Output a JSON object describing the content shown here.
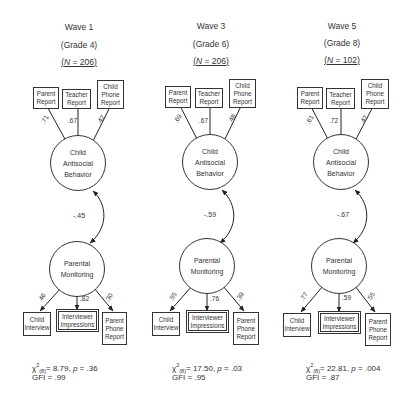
{
  "panels": [
    {
      "wave": "Wave 1",
      "grade": "(Grade 4)",
      "n_prefix": "N",
      "n_text": " = 206",
      "top_indicators": [
        "Parent Report",
        "Teacher Report",
        "Child Phone Report"
      ],
      "top_loadings": [
        ".71",
        ".67",
        ".42"
      ],
      "latent_top": [
        "Child",
        "Antisocial",
        "Behavior"
      ],
      "correlation": "-.45",
      "latent_bottom": [
        "Parental",
        "Monitoring"
      ],
      "bottom_indicators": [
        "Child Interview",
        "Interviewer Impressions",
        "Parent Phone Report"
      ],
      "bottom_loadings": [
        ".46",
        ".82",
        ".30"
      ],
      "fit": {
        "chi_sym": "χ",
        "sup": "2",
        "sub": "(8)",
        "chi_value": "= 8.79, ",
        "p_sym": "p",
        "p_value": " = .36",
        "gfi": "GFI = .99"
      }
    },
    {
      "wave": "Wave 3",
      "grade": "(Grade 6)",
      "n_prefix": "N",
      "n_text": " = 206",
      "top_indicators": [
        "Parent Report",
        "Teacher Report",
        "Child Phone Report"
      ],
      "top_loadings": [
        ".69",
        ".67",
        ".48"
      ],
      "latent_top": [
        "Child",
        "Antisocial",
        "Behavior"
      ],
      "correlation": "-.59",
      "latent_bottom": [
        "Parental",
        "Monitoring"
      ],
      "bottom_indicators": [
        "Child Interview",
        "Interviewer Impressions",
        "Parent Phone Report"
      ],
      "bottom_loadings": [
        ".55",
        ".76",
        ".39"
      ],
      "fit": {
        "chi_sym": "χ",
        "sup": "2",
        "sub": "(8)",
        "chi_value": "= 17.50, ",
        "p_sym": "p",
        "p_value": " = .03",
        "gfi": "GFI = .95"
      }
    },
    {
      "wave": "Wave 5",
      "grade": "(Grade 8)",
      "n_prefix": "N",
      "n_text": " = 102",
      "top_indicators": [
        "Parent Report",
        "Teacher Report",
        "Child Phone Report"
      ],
      "top_loadings": [
        ".61",
        ".72",
        ".47"
      ],
      "latent_top": [
        "Child",
        "Antisocial",
        "Behavior"
      ],
      "correlation": "-.67",
      "latent_bottom": [
        "Parental",
        "Monitoring"
      ],
      "bottom_indicators": [
        "Child Interview",
        "Interviewer Impressions",
        "Parent Phone Report"
      ],
      "bottom_loadings": [
        ".77",
        ".59",
        ".55"
      ],
      "fit": {
        "chi_sym": "χ",
        "sup": "2",
        "sub": "(8)",
        "chi_value": "= 22.81, ",
        "p_sym": "p",
        "p_value": " = .004",
        "gfi": "GFI = .87"
      }
    }
  ]
}
